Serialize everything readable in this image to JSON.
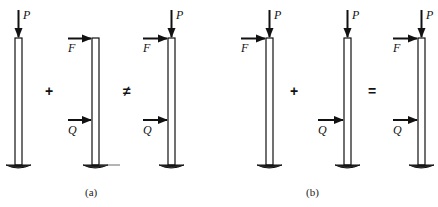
{
  "figure": {
    "panels": [
      {
        "id": "a",
        "caption": "(a)",
        "operators": [
          "+",
          "≠"
        ],
        "columns": [
          {
            "loads": [
              "P"
            ]
          },
          {
            "loads": [
              "F",
              "Q"
            ]
          },
          {
            "loads": [
              "P",
              "F",
              "Q"
            ]
          }
        ]
      },
      {
        "id": "b",
        "caption": "(b)",
        "operators": [
          "+",
          "="
        ],
        "columns": [
          {
            "loads": [
              "P",
              "F"
            ]
          },
          {
            "loads": [
              "P",
              "Q"
            ]
          },
          {
            "loads": [
              "P",
              "F",
              "Q"
            ]
          }
        ]
      }
    ],
    "labels": {
      "P": "P",
      "F": "F",
      "Q": "Q"
    },
    "colors": {
      "stroke": "#111111",
      "background": "#ffffff"
    }
  }
}
